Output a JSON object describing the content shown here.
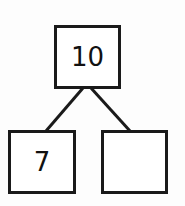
{
  "diagram": {
    "type": "number-bond",
    "whole": {
      "value": "10"
    },
    "parts": [
      {
        "value": "7"
      },
      {
        "value": ""
      }
    ],
    "colors": {
      "stroke": "#1a1a1a",
      "background": "#fdfdfd"
    }
  }
}
